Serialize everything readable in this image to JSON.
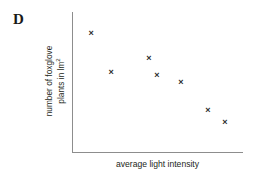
{
  "figure": {
    "panel_label": "D",
    "marker_glyph": "×",
    "marker_color": "#2b2b2b",
    "axis_color": "#8d8d8d",
    "text_color": "#231f20",
    "background": "#ffffff"
  },
  "chart_data": {
    "type": "scatter",
    "title": "D",
    "xlabel": "average light intensity",
    "ylabel_line1": "number of foxglove",
    "ylabel_line2_prefix": "plants in lm",
    "ylabel_line2_superscript": "2",
    "ylabel_full": "number of foxglove plants in lm²",
    "grid": false,
    "legend": "none",
    "xticks": [],
    "yticks": [],
    "xlim": [
      0,
      100
    ],
    "ylim": [
      0,
      100
    ],
    "points": [
      {
        "label": "p1",
        "xpct": 10.6,
        "ypct": 85.0
      },
      {
        "label": "p2",
        "xpct": 22.4,
        "ypct": 57.1
      },
      {
        "label": "p3",
        "xpct": 44.7,
        "ypct": 67.1
      },
      {
        "label": "p4",
        "xpct": 49.4,
        "ypct": 54.3
      },
      {
        "label": "p5",
        "xpct": 63.5,
        "ypct": 50.0
      },
      {
        "label": "p6",
        "xpct": 79.4,
        "ypct": 30.0
      },
      {
        "label": "p7",
        "xpct": 89.4,
        "ypct": 21.4
      }
    ]
  }
}
